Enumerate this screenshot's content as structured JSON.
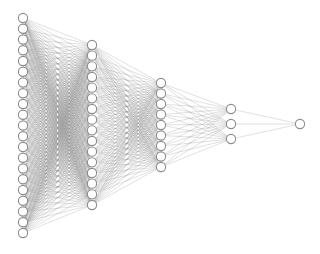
{
  "diagram": {
    "type": "fully-connected-neural-network",
    "background": "#ffffff",
    "node_fill": "#ffffff",
    "node_stroke": "#8c8c8c",
    "edge_color": "#8a8a8a",
    "node_radius": 4.6,
    "layers": [
      {
        "name": "input-layer",
        "nodes": 21,
        "x": 23,
        "y_start": 18,
        "y_end": 233
      },
      {
        "name": "hidden-layer-1",
        "nodes": 16,
        "x": 92,
        "y_start": 45,
        "y_end": 205
      },
      {
        "name": "hidden-layer-2",
        "nodes": 9,
        "x": 161,
        "y_start": 83,
        "y_end": 167
      },
      {
        "name": "hidden-layer-3",
        "nodes": 3,
        "x": 231,
        "y_start": 109,
        "y_end": 139
      },
      {
        "name": "output-layer",
        "nodes": 1,
        "x": 300,
        "y_start": 124,
        "y_end": 124
      }
    ]
  }
}
